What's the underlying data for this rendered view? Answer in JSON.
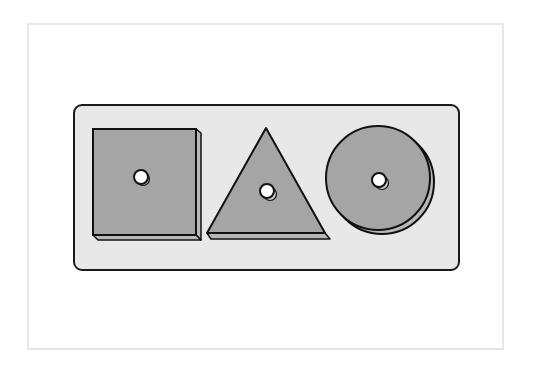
{
  "figure": {
    "colors": {
      "background": "#ffffff",
      "frame_border": "#e6e6e6",
      "board_fill": "#e8e8e8",
      "board_stroke": "#1a1a1a",
      "piece_fill": "#a5a5a5",
      "piece_side": "#b8b8b8",
      "outline": "#111111",
      "peg_hole": "#ffffff"
    },
    "board": {
      "x": 74,
      "y": 105,
      "width": 385,
      "height": 165,
      "corner_radius": 8
    },
    "pieces": [
      {
        "shape": "square",
        "front": {
          "x": 93,
          "y": 129,
          "width": 103,
          "height": 106
        },
        "depth": 5,
        "hole": {
          "cx": 141,
          "cy": 177,
          "r": 7
        }
      },
      {
        "shape": "triangle",
        "points": {
          "apex": [
            266,
            128
          ],
          "left": [
            207,
            233
          ],
          "right": [
            325,
            233
          ]
        },
        "depth": 5,
        "hole": {
          "cx": 267,
          "cy": 191,
          "r": 7
        }
      },
      {
        "shape": "circle",
        "front": {
          "cx": 378,
          "cy": 178,
          "r": 52
        },
        "depth": 5,
        "hole": {
          "cx": 379,
          "cy": 180,
          "r": 7
        }
      }
    ]
  }
}
